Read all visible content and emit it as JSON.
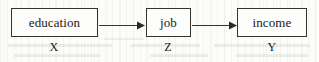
{
  "diagram": {
    "type": "path-diagram",
    "nodes": [
      {
        "id": "education",
        "label": "education",
        "variable": "X"
      },
      {
        "id": "job",
        "label": "job",
        "variable": "Z"
      },
      {
        "id": "income",
        "label": "income",
        "variable": "Y"
      }
    ],
    "edges": [
      {
        "from": "education",
        "to": "job",
        "style": "solid-arrow",
        "direction": "right"
      },
      {
        "from": "job",
        "to": "income",
        "style": "solid-arrow",
        "direction": "right"
      }
    ],
    "colors": {
      "background": "#fcfcfb",
      "node_fill": "#fdfdfc",
      "stroke": "#333330",
      "text": "#1a1a18"
    }
  }
}
